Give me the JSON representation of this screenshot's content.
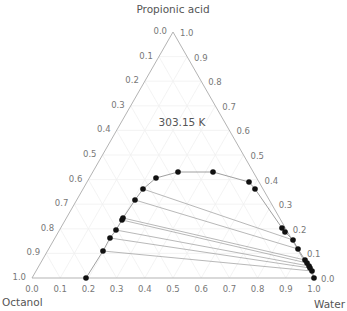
{
  "chart_data": {
    "type": "ternary-scatter",
    "title": "303.15 K",
    "axes": {
      "top": "Propionic acid",
      "left": "Octanol",
      "right": "Water"
    },
    "left_edge_ticks": [
      "0.0",
      "0.1",
      "0.2",
      "0.3",
      "0.4",
      "0.5",
      "0.6",
      "0.7",
      "0.8",
      "0.9",
      "1.0"
    ],
    "right_edge_ticks": [
      "1.0",
      "0.9",
      "0.8",
      "0.7",
      "0.6",
      "0.5",
      "0.4",
      "0.3",
      "0.2",
      "0.1",
      "0.0"
    ],
    "bottom_edge_ticks": [
      "0.0",
      "0.1",
      "0.2",
      "0.3",
      "0.4",
      "0.5",
      "0.6",
      "0.7",
      "0.8",
      "0.9",
      "1.0"
    ],
    "grid": true,
    "binodal_points_px": [
      [
        86,
        278
      ],
      [
        103,
        251
      ],
      [
        110,
        238
      ],
      [
        116,
        230
      ],
      [
        122,
        220
      ],
      [
        123,
        218
      ],
      [
        135,
        200
      ],
      [
        143,
        189
      ],
      [
        156,
        178
      ],
      [
        178,
        172
      ],
      [
        213,
        172
      ],
      [
        249,
        182
      ],
      [
        255,
        189
      ],
      [
        282,
        228
      ],
      [
        285,
        232
      ],
      [
        293,
        240
      ],
      [
        298,
        249
      ],
      [
        305,
        260
      ],
      [
        307,
        263
      ],
      [
        309,
        266
      ],
      [
        310,
        268
      ],
      [
        312,
        271
      ],
      [
        314,
        278
      ]
    ],
    "tie_lines_px": [
      [
        [
          143,
          189
        ],
        [
          293,
          240
        ]
      ],
      [
        [
          135,
          200
        ],
        [
          298,
          249
        ]
      ],
      [
        [
          123,
          218
        ],
        [
          305,
          260
        ]
      ],
      [
        [
          122,
          220
        ],
        [
          307,
          263
        ]
      ],
      [
        [
          116,
          230
        ],
        [
          309,
          266
        ]
      ],
      [
        [
          110,
          238
        ],
        [
          310,
          268
        ]
      ],
      [
        [
          103,
          251
        ],
        [
          312,
          271
        ]
      ]
    ]
  }
}
